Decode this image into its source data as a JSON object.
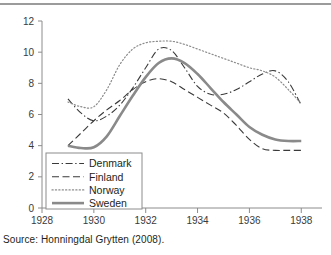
{
  "figure": {
    "source_note": "Source: Honningdal Grytten (2008)."
  },
  "chart_data": {
    "type": "line",
    "title": "",
    "xlabel": "",
    "ylabel": "",
    "xlim": [
      1928,
      1938.8
    ],
    "ylim": [
      0,
      12
    ],
    "xticks": [
      1928,
      1930,
      1932,
      1934,
      1936,
      1938
    ],
    "xtick_labels": [
      "1928",
      "1930",
      "1932",
      "1934",
      "1936",
      "1938"
    ],
    "yticks": [
      0,
      2,
      4,
      6,
      8,
      10,
      12
    ],
    "ytick_labels": [
      "0",
      "2",
      "4",
      "6",
      "8",
      "10",
      "12"
    ],
    "grid": false,
    "legend_position": "lower-left",
    "x": [
      1929,
      1929.5,
      1930,
      1930.5,
      1931,
      1931.5,
      1932,
      1932.5,
      1933,
      1933.5,
      1934,
      1934.5,
      1935,
      1935.5,
      1936,
      1936.5,
      1937,
      1937.5,
      1938
    ],
    "series": [
      {
        "name": "Denmark",
        "style": "dash-dot",
        "color": "#3a3a3a",
        "width": 1.1,
        "values": [
          7.0,
          6.1,
          5.6,
          5.9,
          6.6,
          7.7,
          9.0,
          10.2,
          10.1,
          9.0,
          7.8,
          7.3,
          7.3,
          7.6,
          8.1,
          8.6,
          8.8,
          8.1,
          6.6
        ]
      },
      {
        "name": "Finland",
        "style": "dashed",
        "color": "#3a3a3a",
        "width": 1.1,
        "values": [
          4.0,
          4.8,
          5.6,
          6.3,
          6.9,
          7.6,
          8.1,
          8.3,
          8.1,
          7.6,
          7.1,
          6.6,
          6.1,
          5.3,
          4.4,
          3.8,
          3.7,
          3.7,
          3.7
        ]
      },
      {
        "name": "Norway",
        "style": "dotted",
        "color": "#8c8c8c",
        "width": 1.2,
        "values": [
          6.8,
          6.5,
          6.5,
          7.6,
          9.2,
          10.2,
          10.6,
          10.7,
          10.7,
          10.5,
          10.2,
          9.9,
          9.6,
          9.3,
          9.0,
          8.8,
          8.4,
          7.6,
          6.7
        ]
      },
      {
        "name": "Sweden",
        "style": "solid",
        "color": "#8a8a8a",
        "width": 2.6,
        "values": [
          4.0,
          3.85,
          3.9,
          4.6,
          5.9,
          7.2,
          8.4,
          9.3,
          9.6,
          9.3,
          8.6,
          7.7,
          6.8,
          6.0,
          5.2,
          4.7,
          4.4,
          4.3,
          4.3
        ]
      }
    ]
  },
  "legend": {
    "items": [
      {
        "label": "Denmark"
      },
      {
        "label": "Finland"
      },
      {
        "label": "Norway"
      },
      {
        "label": "Sweden"
      }
    ]
  },
  "colors": {
    "axis": "#8c8c8c",
    "text": "#231f20",
    "sweden": "#8a8a8a",
    "rule": "#9b9b9b"
  }
}
